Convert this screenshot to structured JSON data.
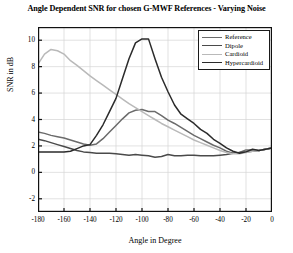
{
  "figure": {
    "title": "Angle Dependent SNR for chosen G-MWF References - Varying Noise",
    "xlabel": "Angle in Degree",
    "ylabel": "SNR in dB"
  },
  "legend": {
    "position": "top-right",
    "items": [
      {
        "label": "Reference",
        "color": "#6b6b6b"
      },
      {
        "label": "Dipole",
        "color": "#4a4a4a"
      },
      {
        "label": "Cardioid",
        "color": "#b9b9b9"
      },
      {
        "label": "Hypercardioid",
        "color": "#2b2b2b"
      }
    ]
  },
  "axes": {
    "xticks": [
      "-180",
      "-160",
      "-140",
      "-120",
      "-100",
      "-80",
      "-60",
      "-40",
      "-20",
      "0"
    ],
    "xtick_values": [
      -180,
      -160,
      -140,
      -120,
      -100,
      -80,
      -60,
      -40,
      -20,
      0
    ],
    "yticks": [
      "-2",
      "0",
      "2",
      "4",
      "6",
      "8",
      "10"
    ],
    "ytick_values": [
      -2,
      0,
      2,
      4,
      6,
      8,
      10
    ],
    "xlim": [
      -180,
      0
    ],
    "ylim": [
      -3,
      11
    ],
    "grid": true
  },
  "chart_data": {
    "type": "line",
    "title": "Angle Dependent SNR for chosen G-MWF References - Varying Noise",
    "xlabel": "Angle in Degree",
    "ylabel": "SNR in dB",
    "xlim": [
      -180,
      0
    ],
    "ylim": [
      -3,
      11
    ],
    "grid": true,
    "legend_position": "top-right",
    "x": [
      -180,
      -175,
      -170,
      -165,
      -160,
      -155,
      -150,
      -145,
      -140,
      -135,
      -130,
      -125,
      -120,
      -115,
      -110,
      -105,
      -100,
      -95,
      -90,
      -85,
      -80,
      -75,
      -70,
      -65,
      -60,
      -55,
      -50,
      -45,
      -40,
      -35,
      -30,
      -25,
      -20,
      -15,
      -10,
      -5,
      0
    ],
    "series": [
      {
        "name": "Reference",
        "color": "#6b6b6b",
        "values": [
          3.05,
          2.95,
          2.8,
          2.7,
          2.6,
          2.45,
          2.3,
          2.15,
          2.05,
          2.15,
          2.55,
          3.05,
          3.55,
          4.05,
          4.5,
          4.7,
          4.75,
          4.6,
          4.6,
          4.3,
          3.95,
          3.7,
          3.4,
          3.1,
          2.8,
          2.55,
          2.3,
          2.05,
          1.85,
          1.6,
          1.45,
          1.5,
          1.7,
          1.7,
          1.65,
          1.75,
          1.85
        ]
      },
      {
        "name": "Dipole",
        "color": "#4a4a4a",
        "values": [
          2.5,
          2.4,
          2.25,
          2.1,
          1.95,
          1.8,
          1.65,
          1.55,
          1.5,
          1.45,
          1.45,
          1.45,
          1.4,
          1.35,
          1.3,
          1.35,
          1.3,
          1.25,
          1.15,
          1.2,
          1.35,
          1.25,
          1.25,
          1.3,
          1.3,
          1.25,
          1.25,
          1.25,
          1.3,
          1.35,
          1.45,
          1.5,
          1.55,
          1.6,
          1.65,
          1.75,
          1.85
        ]
      },
      {
        "name": "Cardioid",
        "color": "#b9b9b9",
        "values": [
          8.2,
          8.95,
          9.3,
          9.2,
          8.95,
          8.45,
          8.1,
          7.7,
          7.3,
          6.95,
          6.6,
          6.25,
          5.9,
          5.55,
          5.2,
          4.9,
          4.6,
          4.3,
          4.0,
          3.7,
          3.45,
          3.2,
          2.95,
          2.7,
          2.45,
          2.25,
          2.05,
          1.85,
          1.65,
          1.5,
          1.4,
          1.4,
          1.5,
          1.6,
          1.65,
          1.75,
          1.85
        ]
      },
      {
        "name": "Hypercardioid",
        "color": "#2b2b2b",
        "values": [
          1.55,
          1.55,
          1.55,
          1.55,
          1.55,
          1.6,
          1.8,
          2.0,
          2.1,
          2.8,
          3.6,
          4.6,
          5.6,
          7.1,
          8.6,
          9.8,
          10.1,
          10.1,
          8.6,
          7.2,
          6.1,
          5.1,
          4.4,
          4.05,
          3.7,
          3.25,
          2.95,
          2.5,
          2.2,
          1.85,
          1.6,
          1.45,
          1.55,
          1.75,
          1.65,
          1.75,
          1.85
        ]
      }
    ]
  }
}
